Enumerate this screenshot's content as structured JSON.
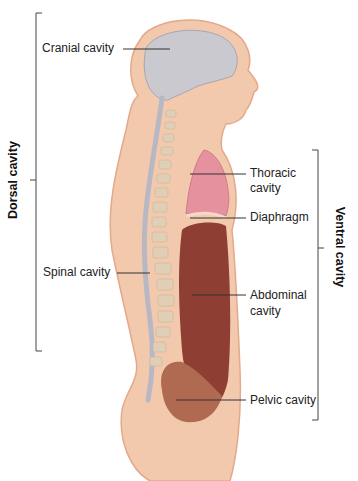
{
  "diagram": {
    "colors": {
      "skin": "#f3c9ad",
      "skin_outline": "#e3a98a",
      "cranial": "#c9c9cf",
      "spinal": "#b8b8c4",
      "vertebra": "#e0cfb6",
      "thoracic": "#e6929e",
      "abdominal": "#8e3e33",
      "pelvic": "#b06a52",
      "leader": "#333333"
    },
    "brackets": {
      "dorsal": "Dorsal cavity",
      "ventral": "Ventral cavity"
    },
    "labels": {
      "cranial": "Cranial cavity",
      "thoracic_1": "Thoracic",
      "thoracic_2": "cavity",
      "diaphragm": "Diaphragm",
      "spinal": "Spinal cavity",
      "abdominal_1": "Abdominal",
      "abdominal_2": "cavity",
      "pelvic": "Pelvic cavity"
    }
  }
}
